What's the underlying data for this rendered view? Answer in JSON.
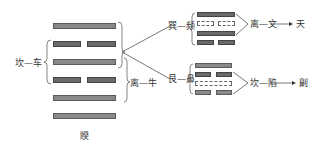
{
  "main_hexagram": {
    "name": "睽",
    "lines_top_to_bottom": [
      "yang",
      "yin",
      "yang",
      "yin",
      "yang",
      "yang"
    ]
  },
  "main_labels": {
    "left_group": "坎—车",
    "right_group": "离—牛"
  },
  "upper_branch": {
    "label": "巽—频",
    "lines_top_to_bottom": [
      "yang",
      "yin-hollow",
      "yang",
      "yin"
    ],
    "result_label": "离—文",
    "arrow_target": "天"
  },
  "lower_branch": {
    "label": "艮—鼻",
    "lines_top_to_bottom": [
      "yang",
      "yin",
      "yang-hollow",
      "yin"
    ],
    "result_label": "坎—陷",
    "arrow_target": "劓"
  },
  "colors": {
    "line_fill": "#8a8a8a",
    "line_border": "#5a5a5a",
    "stroke": "#555555",
    "text": "#333333"
  }
}
